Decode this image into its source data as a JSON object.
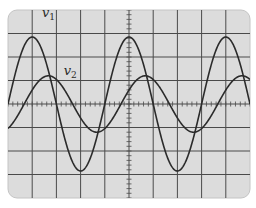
{
  "chart_data": {
    "type": "line",
    "title": "",
    "xlabel": "",
    "ylabel": "",
    "grid": true,
    "grid_divisions": {
      "horizontal": 10,
      "vertical": 8
    },
    "x_range_divisions": [
      -5,
      5
    ],
    "y_range_divisions": [
      -4,
      4
    ],
    "period_divisions": 4,
    "series": [
      {
        "name": "v1",
        "label": "v",
        "subscript": "1",
        "amplitude_divisions": 2.85,
        "phase_shift_divisions": 0,
        "color": "#2b2b2b"
      },
      {
        "name": "v2",
        "label": "v",
        "subscript": "2",
        "amplitude_divisions": 1.2,
        "phase_shift_divisions": 0.67,
        "color": "#2b2b2b"
      }
    ],
    "annotations": [
      {
        "text": "v1",
        "x_div": -3.6,
        "y_div": 3.7
      },
      {
        "text": "v2",
        "x_div": -2.7,
        "y_div": 1.25
      }
    ]
  },
  "colors": {
    "screen": "#dcdcdc",
    "grid": "#4a4a4a",
    "trace": "#2b2b2b",
    "border": "#b8b8b8"
  }
}
